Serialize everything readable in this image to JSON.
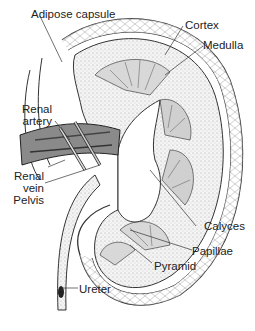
{
  "diagram": {
    "labels": {
      "adipose_capsule": "Adipose capsule",
      "cortex": "Cortex",
      "medulla": "Medulla",
      "renal_artery_1": "Renal",
      "renal_artery_2": "artery",
      "renal_vein_1": "Renal",
      "renal_vein_2": "vein",
      "pelvis": "Pelvis",
      "calyces": "Calyces",
      "papillae": "Papillae",
      "pyramid": "Pyramid",
      "ureter": "Ureter"
    },
    "colors": {
      "ink": "#222222",
      "background": "#ffffff",
      "stipple": "#bdbdbd"
    }
  }
}
